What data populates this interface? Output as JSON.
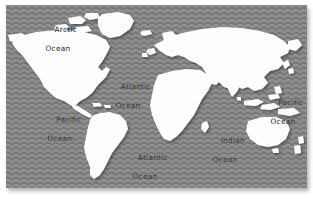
{
  "map": {
    "title": "World Map",
    "projection": "equirectangular-stylized",
    "colors": {
      "ocean": "#858585",
      "ocean_wave_line": "#6f6f6f",
      "land": "#fdfdfd",
      "land_shadow": "#4a4a4a",
      "label_text": "#2b2b2b",
      "page_background": "#ffffff"
    },
    "plate": {
      "x": 6,
      "y": 5,
      "width": 301,
      "height": 183
    },
    "labels": [
      {
        "id": "arctic-ocean",
        "line1": "Arctic",
        "line2": "Ocean",
        "x": 52,
        "y": 16
      },
      {
        "id": "atlantic-ocean-north",
        "line1": "Atlantic",
        "line2": "Ocean",
        "x": 122,
        "y": 77
      },
      {
        "id": "pacific-ocean-west",
        "line1": "Pacific",
        "line2": "Ocean.",
        "x": 55,
        "y": 110
      },
      {
        "id": "pacific-ocean-east",
        "line1": "Pacific",
        "line2": "Ocean",
        "x": 277,
        "y": 93
      },
      {
        "id": "atlantic-ocean-south",
        "line1": "Atlantic",
        "line2": "Ocean",
        "x": 139,
        "y": 148
      },
      {
        "id": "indian-ocean",
        "line1": "Indian",
        "line2": "Ocean",
        "x": 219,
        "y": 131
      }
    ],
    "landmasses": [
      "North America",
      "South America",
      "Greenland",
      "Europe",
      "Africa",
      "Asia",
      "Australia",
      "New Zealand",
      "Antarctica-omitted",
      "Indonesia",
      "Japan",
      "British Isles",
      "Madagascar",
      "Iceland"
    ]
  }
}
